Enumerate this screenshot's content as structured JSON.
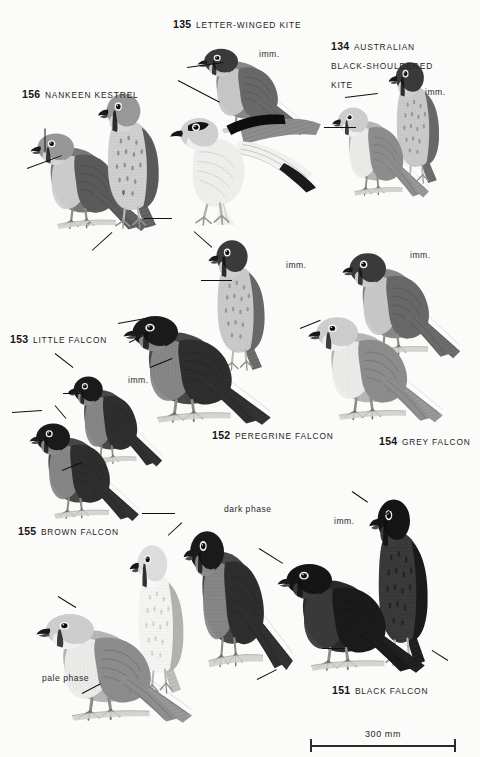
{
  "page": {
    "kind": "field-guide-plate",
    "background_color": "#fbfbf9",
    "ink_color": "#141414",
    "width": 480,
    "height": 757
  },
  "species": [
    {
      "id": "nankeen-kestrel",
      "number": "156",
      "name": "NANKEEN KESTREL",
      "x": 22,
      "y": 84,
      "two_line": false
    },
    {
      "id": "letter-winged-kite",
      "number": "135",
      "name": "LETTER-WINGED KITE",
      "x": 173,
      "y": 14,
      "two_line": false
    },
    {
      "id": "australian-black-shouldered-kite",
      "number": "134",
      "name": "AUSTRALIAN BLACK-SHOULDERED KITE",
      "x": 331,
      "y": 36,
      "two_line": true
    },
    {
      "id": "little-falcon",
      "number": "153",
      "name": "LITTLE FALCON",
      "x": 10,
      "y": 329,
      "two_line": false
    },
    {
      "id": "peregrine-falcon",
      "number": "152",
      "name": "PEREGRINE FALCON",
      "x": 212,
      "y": 425,
      "two_line": false
    },
    {
      "id": "grey-falcon",
      "number": "154",
      "name": "GREY FALCON",
      "x": 379,
      "y": 431,
      "two_line": false
    },
    {
      "id": "brown-falcon",
      "number": "155",
      "name": "BROWN FALCON",
      "x": 18,
      "y": 521,
      "two_line": false
    },
    {
      "id": "black-falcon",
      "number": "151",
      "name": "BLACK FALCON",
      "x": 332,
      "y": 680,
      "two_line": false
    }
  ],
  "annotations": [
    {
      "id": "imm-letter-winged-kite",
      "text": "imm.",
      "x": 259,
      "y": 49
    },
    {
      "id": "imm-black-shouldered-kite",
      "text": "imm.",
      "x": 425,
      "y": 87
    },
    {
      "id": "imm-peregrine-falcon",
      "text": "imm.",
      "x": 286,
      "y": 260
    },
    {
      "id": "imm-grey-falcon",
      "text": "imm.",
      "x": 410,
      "y": 250
    },
    {
      "id": "imm-little-falcon",
      "text": "imm.",
      "x": 128,
      "y": 375
    },
    {
      "id": "imm-black-falcon",
      "text": "imm.",
      "x": 334,
      "y": 516
    },
    {
      "id": "dark-phase-brown-falcon",
      "text": "dark phase",
      "x": 224,
      "y": 504
    },
    {
      "id": "pale-phase-brown-falcon",
      "text": "pale phase",
      "x": 42,
      "y": 673
    }
  ],
  "sex_symbols": [
    {
      "id": "female-symbol-kestrel",
      "glyph": "♀",
      "x": 120,
      "y": 188
    },
    {
      "id": "male-symbol-kestrel",
      "glyph": "♂",
      "x": 85,
      "y": 219
    }
  ],
  "scale": {
    "label": "300 mm",
    "x": 310,
    "y": 735,
    "length_px": 146
  },
  "leaders": [
    {
      "id": "leader-kestrel-crown",
      "x1": 45,
      "y1": 128,
      "x2": 45,
      "y2": 152
    },
    {
      "id": "leader-kestrel-face",
      "x1": 27,
      "y1": 168,
      "x2": 62,
      "y2": 155
    },
    {
      "id": "leader-kestrel-tail",
      "x1": 172,
      "y1": 218,
      "x2": 144,
      "y2": 218
    },
    {
      "id": "leader-kestrel-underwing",
      "x1": 92,
      "y1": 250,
      "x2": 112,
      "y2": 232
    },
    {
      "id": "leader-lwk-shoulder",
      "x1": 187,
      "y1": 67,
      "x2": 224,
      "y2": 62
    },
    {
      "id": "leader-lwk-underwing",
      "x1": 178,
      "y1": 80,
      "x2": 220,
      "y2": 102
    },
    {
      "id": "leader-bsk-shoulder",
      "x1": 345,
      "y1": 97,
      "x2": 378,
      "y2": 93
    },
    {
      "id": "leader-bsk-wingpatch",
      "x1": 324,
      "y1": 127,
      "x2": 356,
      "y2": 127
    },
    {
      "id": "leader-peregrine-imm-breast",
      "x1": 201,
      "y1": 280,
      "x2": 232,
      "y2": 280
    },
    {
      "id": "leader-peregrine-crown",
      "x1": 194,
      "y1": 231,
      "x2": 212,
      "y2": 247
    },
    {
      "id": "leader-peregrine-throat",
      "x1": 118,
      "y1": 323,
      "x2": 146,
      "y2": 318
    },
    {
      "id": "leader-peregrine-flank",
      "x1": 129,
      "y1": 342,
      "x2": 150,
      "y2": 332
    },
    {
      "id": "leader-peregrine-leg",
      "x1": 150,
      "y1": 367,
      "x2": 172,
      "y2": 358
    },
    {
      "id": "leader-grey-moustache",
      "x1": 300,
      "y1": 328,
      "x2": 320,
      "y2": 320
    },
    {
      "id": "leader-little-crown",
      "x1": 55,
      "y1": 353,
      "x2": 73,
      "y2": 367
    },
    {
      "id": "leader-little-breast",
      "x1": 63,
      "y1": 393,
      "x2": 86,
      "y2": 393
    },
    {
      "id": "leader-little-face2",
      "x1": 12,
      "y1": 412,
      "x2": 42,
      "y2": 410
    },
    {
      "id": "leader-little-shoulder",
      "x1": 55,
      "y1": 405,
      "x2": 66,
      "y2": 418
    },
    {
      "id": "leader-little-flank",
      "x1": 62,
      "y1": 470,
      "x2": 82,
      "y2": 462
    },
    {
      "id": "leader-brown-dark-crown",
      "x1": 142,
      "y1": 513,
      "x2": 175,
      "y2": 513
    },
    {
      "id": "leader-brown-dark-throat",
      "x1": 168,
      "y1": 535,
      "x2": 182,
      "y2": 522
    },
    {
      "id": "leader-brown-pale-face",
      "x1": 58,
      "y1": 596,
      "x2": 76,
      "y2": 607
    },
    {
      "id": "leader-brown-pale-leg",
      "x1": 82,
      "y1": 693,
      "x2": 101,
      "y2": 683
    },
    {
      "id": "leader-brown-tail",
      "x1": 257,
      "y1": 679,
      "x2": 277,
      "y2": 669
    },
    {
      "id": "leader-black-falcon-crown",
      "x1": 352,
      "y1": 491,
      "x2": 368,
      "y2": 502
    },
    {
      "id": "leader-black-falcon-face",
      "x1": 377,
      "y1": 521,
      "x2": 391,
      "y2": 509
    },
    {
      "id": "leader-black-falcon-shoulder",
      "x1": 259,
      "y1": 548,
      "x2": 283,
      "y2": 563
    },
    {
      "id": "leader-black-falcon-leg",
      "x1": 322,
      "y1": 648,
      "x2": 345,
      "y2": 648
    },
    {
      "id": "leader-black-falcon-tail",
      "x1": 448,
      "y1": 660,
      "x2": 432,
      "y2": 650
    }
  ],
  "birds": [
    {
      "id": "kestrel-male-perched",
      "label": "nankeen-kestrel-male",
      "x": 18,
      "y": 110,
      "w": 140,
      "h": 130,
      "tone": "rufous",
      "flip": false,
      "rot": 0
    },
    {
      "id": "kestrel-female-perched",
      "label": "nankeen-kestrel-female",
      "x": 78,
      "y": 78,
      "w": 130,
      "h": 150,
      "tone": "rufous",
      "flip": false,
      "rot": 0
    },
    {
      "id": "lwk-perched-imm",
      "label": "letter-winged-kite-immature",
      "x": 186,
      "y": 28,
      "w": 130,
      "h": 115,
      "tone": "mid",
      "flip": false,
      "rot": 0
    },
    {
      "id": "lwk-spread-adult",
      "label": "letter-winged-kite-adult",
      "x": 164,
      "y": 70,
      "w": 160,
      "h": 155,
      "tone": "pale",
      "flip": false,
      "rot": 0
    },
    {
      "id": "bsk-perched-imm",
      "label": "black-shouldered-kite-immature",
      "x": 372,
      "y": 48,
      "w": 108,
      "h": 135,
      "tone": "mid",
      "flip": false,
      "rot": 0
    },
    {
      "id": "bsk-perched-adult",
      "label": "black-shouldered-kite-adult",
      "x": 322,
      "y": 86,
      "w": 115,
      "h": 120,
      "tone": "pale",
      "flip": false,
      "rot": 0
    },
    {
      "id": "peregrine-imm",
      "label": "peregrine-falcon-immature",
      "x": 190,
      "y": 225,
      "w": 120,
      "h": 145,
      "tone": "mid",
      "flip": false,
      "rot": 0
    },
    {
      "id": "peregrine-adult",
      "label": "peregrine-falcon-adult",
      "x": 108,
      "y": 290,
      "w": 175,
      "h": 145,
      "tone": "dark",
      "flip": false,
      "rot": 0
    },
    {
      "id": "grey-falcon-imm",
      "label": "grey-falcon-immature",
      "x": 330,
      "y": 228,
      "w": 140,
      "h": 140,
      "tone": "mid",
      "flip": false,
      "rot": 0
    },
    {
      "id": "grey-falcon-adult",
      "label": "grey-falcon-adult",
      "x": 294,
      "y": 292,
      "w": 160,
      "h": 140,
      "tone": "pale",
      "flip": false,
      "rot": 0
    },
    {
      "id": "little-falcon-imm",
      "label": "little-falcon-immature",
      "x": 58,
      "y": 355,
      "w": 112,
      "h": 120,
      "tone": "dark",
      "flip": false,
      "rot": 0
    },
    {
      "id": "little-falcon-adult",
      "label": "little-falcon-adult",
      "x": 18,
      "y": 400,
      "w": 130,
      "h": 130,
      "tone": "dark",
      "flip": false,
      "rot": 0
    },
    {
      "id": "brown-falcon-dark",
      "label": "brown-falcon-dark-phase",
      "x": 172,
      "y": 498,
      "w": 130,
      "h": 185,
      "tone": "dark",
      "flip": false,
      "rot": 0
    },
    {
      "id": "brown-falcon-mid",
      "label": "brown-falcon-pale-front",
      "x": 112,
      "y": 528,
      "w": 115,
      "h": 165,
      "tone": "verypale",
      "flip": false,
      "rot": 0
    },
    {
      "id": "brown-falcon-pale",
      "label": "brown-falcon-pale-phase",
      "x": 20,
      "y": 588,
      "w": 185,
      "h": 145,
      "tone": "pale",
      "flip": false,
      "rot": 0
    },
    {
      "id": "black-falcon-imm",
      "label": "black-falcon-immature",
      "x": 350,
      "y": 480,
      "w": 125,
      "h": 185,
      "tone": "verydark",
      "flip": false,
      "rot": 0
    },
    {
      "id": "black-falcon-adult",
      "label": "black-falcon-adult",
      "x": 262,
      "y": 538,
      "w": 175,
      "h": 145,
      "tone": "verydark",
      "flip": false,
      "rot": 0
    }
  ]
}
